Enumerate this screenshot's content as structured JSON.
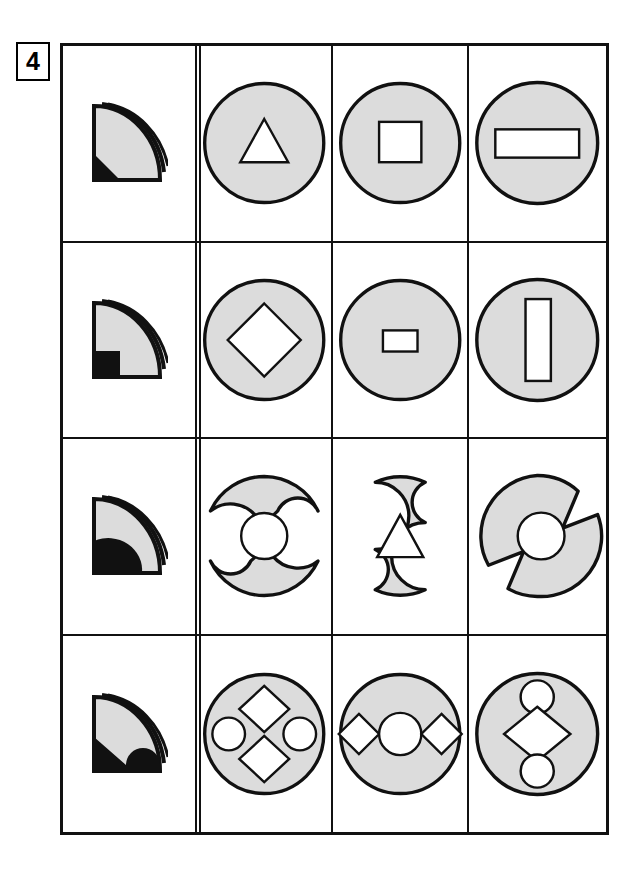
{
  "puzzle": {
    "number": "4",
    "type": "visual-reasoning-matrix",
    "grid": {
      "rows": 4,
      "columns": 4
    },
    "colors": {
      "shape_fill": "#dcdcdc",
      "shape_stroke": "#111111",
      "cutout_fill": "#ffffff",
      "black_fill": "#111111",
      "background": "#ffffff",
      "border": "#111111"
    },
    "column_roles": [
      "key-fan-icon",
      "option-a",
      "option-b",
      "option-c"
    ],
    "rows": [
      {
        "index": 1,
        "key": {
          "name": "fan-quarter-disc-icon",
          "black_region": "triangle-corner-bottom-left",
          "description": "Quarter disc fan with small black triangular corner at bottom left"
        },
        "cells": [
          {
            "col": 2,
            "shape": "circle",
            "outline": "full",
            "cutouts": [
              "triangle"
            ],
            "arrangement": "center"
          },
          {
            "col": 3,
            "shape": "circle",
            "outline": "full",
            "cutouts": [
              "square"
            ],
            "arrangement": "center"
          },
          {
            "col": 4,
            "shape": "circle",
            "outline": "full",
            "cutouts": [
              "wide-rectangle"
            ],
            "arrangement": "center"
          }
        ]
      },
      {
        "index": 2,
        "key": {
          "name": "fan-quarter-disc-icon",
          "black_region": "square-corner-bottom-left",
          "description": "Quarter disc fan with black square notch at bottom left"
        },
        "cells": [
          {
            "col": 2,
            "shape": "circle",
            "outline": "full",
            "cutouts": [
              "diamond"
            ],
            "arrangement": "center"
          },
          {
            "col": 3,
            "shape": "circle",
            "outline": "full",
            "cutouts": [
              "small-rectangle"
            ],
            "arrangement": "center"
          },
          {
            "col": 4,
            "shape": "circle",
            "outline": "full",
            "cutouts": [
              "tall-rectangle"
            ],
            "arrangement": "center"
          }
        ]
      },
      {
        "index": 3,
        "key": {
          "name": "fan-quarter-disc-icon",
          "black_region": "quarter-disc-bottom-left",
          "description": "Quarter disc fan with black rounded wedge at bottom left"
        },
        "cells": [
          {
            "col": 2,
            "shape": "circle",
            "outline": "notched-top-bottom",
            "cutouts": [
              "circle"
            ],
            "arrangement": "center"
          },
          {
            "col": 3,
            "shape": "circle",
            "outline": "notched-left-right",
            "cutouts": [
              "triangle"
            ],
            "arrangement": "center"
          },
          {
            "col": 4,
            "shape": "circle",
            "outline": "wedge-notched",
            "cutouts": [
              "circle"
            ],
            "arrangement": "center"
          }
        ]
      },
      {
        "index": 4,
        "key": {
          "name": "fan-quarter-disc-icon",
          "black_region": "band-with-semicircle-bottom",
          "description": "Quarter disc fan with black bottom band and semicircular bump"
        },
        "cells": [
          {
            "col": 2,
            "shape": "circle",
            "outline": "full",
            "cutouts": [
              "diamond",
              "circle",
              "circle",
              "diamond"
            ],
            "arrangement": "four-around-center"
          },
          {
            "col": 3,
            "shape": "circle",
            "outline": "full",
            "cutouts": [
              "diamond",
              "circle",
              "diamond"
            ],
            "arrangement": "horizontal-row"
          },
          {
            "col": 4,
            "shape": "circle",
            "outline": "full",
            "cutouts": [
              "circle",
              "diamond",
              "circle"
            ],
            "arrangement": "vertical-column"
          }
        ]
      }
    ]
  }
}
